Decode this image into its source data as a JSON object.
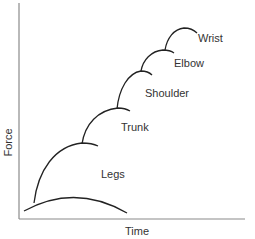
{
  "diagram": {
    "title": "",
    "axes": {
      "x_label": "Time",
      "y_label": "Force"
    },
    "segments": [
      {
        "label": "Legs"
      },
      {
        "label": "Trunk"
      },
      {
        "label": "Shoulder"
      },
      {
        "label": "Elbow"
      },
      {
        "label": "Wrist"
      }
    ],
    "colors": {
      "line": "#222222",
      "axis": "#888888",
      "text": "#333333"
    }
  }
}
